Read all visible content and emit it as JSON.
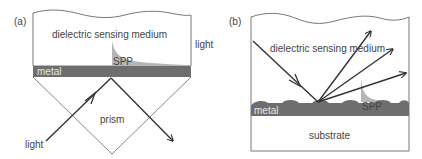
{
  "figure": {
    "panel_a": {
      "tag": "(a)",
      "labels": {
        "medium": "dielectric sensing medium",
        "spp": "SPP",
        "metal": "metal",
        "prism": "prism",
        "light_in": "light",
        "light_out": "light"
      }
    },
    "panel_b": {
      "tag": "(b)",
      "labels": {
        "medium": "dielectric sensing medium",
        "spp": "SPP",
        "metal": "metal",
        "substrate": "substrate"
      }
    },
    "colors": {
      "metal": "#6e6e6e",
      "spp_field": "#b5b5b5",
      "line": "#333333",
      "outline": "#555555"
    }
  }
}
